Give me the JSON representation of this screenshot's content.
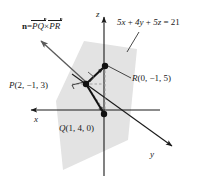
{
  "figure": {
    "type": "3d-geometry-diagram",
    "background_color": "#ffffff",
    "plane_fill_color": "#e3e3e3",
    "line_color": "#1a1a1a",
    "vector_color": "#555555"
  },
  "axes": {
    "x_label": "x",
    "y_label": "y",
    "z_label": "z",
    "origin_px": [
      104,
      110
    ]
  },
  "plane": {
    "equation": "5x + 4y + 5z = 21",
    "equation_parts": {
      "term1": "5x",
      "plus1": "+",
      "term2": "4y",
      "plus2": "+",
      "term3": "5z",
      "equals": "=",
      "rhs": "21"
    }
  },
  "normal_vector": {
    "symbol": "n",
    "equals": "=",
    "first": "PQ",
    "cross": "×",
    "second": "PR"
  },
  "points": [
    {
      "id": "P",
      "label_name": "P",
      "coords": "(2, −1, 3)",
      "px": [
        86,
        84
      ]
    },
    {
      "id": "Q",
      "label_name": "Q",
      "coords": "(1, 4, 0)",
      "px": [
        104,
        114
      ]
    },
    {
      "id": "R",
      "label_name": "R",
      "coords": "(0, −1, 5)",
      "px": [
        105,
        66
      ]
    }
  ],
  "markers": {
    "right_angle_at_P": true
  }
}
